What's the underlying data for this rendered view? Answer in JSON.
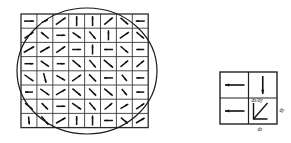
{
  "figure": {
    "background": "#ffffff",
    "width": 291,
    "height": 143
  },
  "vector_field": {
    "name": "gradient-orientation-grid",
    "rows": 8,
    "cols": 8,
    "grid_left": 21,
    "grid_top": 14,
    "cell_w": 15.9,
    "cell_h": 14.2,
    "stroke_color": "#111111",
    "grid_color": "#3a3a3a",
    "angles_deg": [
      [
        0,
        25,
        35,
        90,
        90,
        40,
        -40,
        180
      ],
      [
        35,
        140,
        0,
        -35,
        -50,
        90,
        35,
        -40
      ],
      [
        30,
        30,
        35,
        0,
        90,
        180,
        -40,
        180
      ],
      [
        0,
        -35,
        0,
        -40,
        -50,
        -40,
        40,
        40
      ],
      [
        -35,
        -75,
        -30,
        35,
        -45,
        180,
        -50,
        180
      ],
      [
        180,
        -35,
        30,
        -40,
        -45,
        -40,
        -50,
        180
      ],
      [
        -40,
        -45,
        0,
        -35,
        -50,
        40,
        30,
        35
      ],
      [
        -85,
        -50,
        30,
        90,
        90,
        180,
        -40,
        30
      ]
    ],
    "lengths": [
      [
        10,
        7,
        12,
        10,
        10,
        11,
        10,
        9
      ],
      [
        11,
        10,
        9,
        10,
        10,
        10,
        11,
        10
      ],
      [
        12,
        11,
        11,
        9,
        10,
        9,
        10,
        8
      ],
      [
        9,
        10,
        8,
        11,
        10,
        12,
        10,
        10
      ],
      [
        11,
        10,
        10,
        11,
        10,
        9,
        8,
        8
      ],
      [
        8,
        11,
        11,
        11,
        10,
        11,
        8,
        8
      ],
      [
        10,
        9,
        9,
        11,
        10,
        10,
        9,
        10
      ],
      [
        8,
        11,
        11,
        9,
        10,
        9,
        9,
        10
      ]
    ]
  },
  "region": {
    "name": "circular-support-region",
    "shape": "ellipse",
    "cx": 87,
    "cy": 71,
    "rx": 70,
    "ry": 63,
    "stroke_color": "#1a1a1a"
  },
  "legend": {
    "name": "derivative-key",
    "box_left": 220,
    "box_top": 72,
    "box_w": 57,
    "box_h": 52,
    "cells": [
      {
        "id": "top-left",
        "glyph": "arrow-left",
        "label": ""
      },
      {
        "id": "top-right",
        "glyph": "arrow-down",
        "label": ""
      },
      {
        "id": "bottom-left",
        "glyph": "arrow-left",
        "label": ""
      },
      {
        "id": "bottom-right",
        "glyph": "derivative-triangle",
        "label": "dx/dy"
      }
    ],
    "labels": {
      "ratio": "dx/dy",
      "dy": "dy",
      "dx": "dx"
    }
  }
}
